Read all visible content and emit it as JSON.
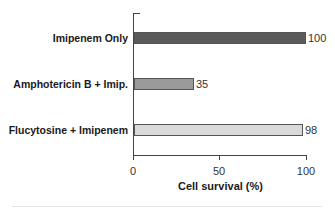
{
  "chart_data": {
    "type": "bar",
    "orientation": "horizontal",
    "title": "",
    "categories": [
      "Imipenem Only",
      "Amphotericin B + Imip.",
      "Flucytosine + Imipenem"
    ],
    "values": [
      100,
      35,
      98
    ],
    "value_labels": [
      "100",
      "35",
      "98"
    ],
    "bar_colors": [
      "#5a5a5a",
      "#9a9a9a",
      "#d9d9d9"
    ],
    "xlabel": "Cell survival (%)",
    "ylabel": "",
    "xlim": [
      0,
      100
    ],
    "xticks": [
      0,
      50,
      100
    ],
    "xtick_labels": [
      "0",
      "50",
      "100"
    ],
    "grid": false,
    "legend": null
  }
}
